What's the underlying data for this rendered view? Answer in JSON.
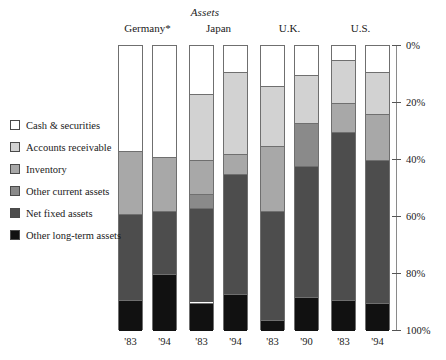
{
  "chart_data": {
    "type": "bar",
    "subtype": "stacked-bar-100-percent",
    "title": "Assets",
    "xlabel": "",
    "ylabel": "",
    "ylim": [
      0,
      100
    ],
    "y_axis_inverted": true,
    "grid": false,
    "legend_position": "left",
    "ytick_labels": [
      "0%",
      "20%",
      "40%",
      "60%",
      "80%",
      "100%"
    ],
    "ytick_values": [
      0,
      20,
      40,
      60,
      80,
      100
    ],
    "groups": [
      "Germany*",
      "Japan",
      "U.K.",
      "U.S."
    ],
    "categories": [
      "'83",
      "'94",
      "'83",
      "'94",
      "'83",
      "'90",
      "'83",
      "'94"
    ],
    "series": [
      {
        "name": "Cash & securities",
        "color": "#ffffff",
        "values": [
          37,
          39,
          17,
          9,
          14,
          10,
          5,
          9
        ]
      },
      {
        "name": "Accounts receivable",
        "color": "#d2d2d2",
        "values": [
          0,
          0,
          23,
          29,
          21,
          17,
          15,
          15
        ]
      },
      {
        "name": "Inventory",
        "color": "#a8a8a8",
        "values": [
          22,
          19,
          12,
          7,
          23,
          0,
          10,
          16
        ]
      },
      {
        "name": "Other current assets",
        "color": "#8a8a8a",
        "values": [
          0,
          0,
          5,
          0,
          0,
          15,
          0,
          0
        ]
      },
      {
        "name": "Net fixed assets",
        "color": "#4d4d4d",
        "values": [
          30,
          22,
          33,
          42,
          38,
          46,
          59,
          50
        ]
      },
      {
        "name": "Other long-term assets",
        "color": "#111111",
        "values": [
          11,
          20,
          10,
          13,
          4,
          12,
          11,
          10
        ]
      }
    ],
    "bars": [
      {
        "group": "Germany*",
        "category": "'83",
        "segments": [
          {
            "name": "Cash & securities",
            "value": 37
          },
          {
            "name": "Inventory",
            "value": 22
          },
          {
            "name": "Net fixed assets",
            "value": 30
          },
          {
            "name": "Other long-term assets",
            "value": 11
          }
        ]
      },
      {
        "group": "Germany*",
        "category": "'94",
        "segments": [
          {
            "name": "Cash & securities",
            "value": 39
          },
          {
            "name": "Inventory",
            "value": 19
          },
          {
            "name": "Net fixed assets",
            "value": 22
          },
          {
            "name": "Other long-term assets",
            "value": 20
          }
        ]
      },
      {
        "group": "Japan",
        "category": "'83",
        "segments": [
          {
            "name": "Cash & securities",
            "value": 17
          },
          {
            "name": "Accounts receivable",
            "value": 23
          },
          {
            "name": "Inventory",
            "value": 12
          },
          {
            "name": "Other current assets",
            "value": 5
          },
          {
            "name": "Net fixed assets",
            "value": 33
          },
          {
            "name": "Other long-term assets",
            "value": 10
          }
        ]
      },
      {
        "group": "Japan",
        "category": "'94",
        "segments": [
          {
            "name": "Cash & securities",
            "value": 9
          },
          {
            "name": "Accounts receivable",
            "value": 29
          },
          {
            "name": "Inventory",
            "value": 7
          },
          {
            "name": "Net fixed assets",
            "value": 42
          },
          {
            "name": "Other long-term assets",
            "value": 13
          }
        ]
      },
      {
        "group": "U.K.",
        "category": "'83",
        "segments": [
          {
            "name": "Cash & securities",
            "value": 14
          },
          {
            "name": "Accounts receivable",
            "value": 21
          },
          {
            "name": "Inventory",
            "value": 23
          },
          {
            "name": "Net fixed assets",
            "value": 38
          },
          {
            "name": "Other long-term assets",
            "value": 4
          }
        ]
      },
      {
        "group": "U.K.",
        "category": "'90",
        "segments": [
          {
            "name": "Cash & securities",
            "value": 10
          },
          {
            "name": "Accounts receivable",
            "value": 17
          },
          {
            "name": "Other current assets",
            "value": 15
          },
          {
            "name": "Net fixed assets",
            "value": 46
          },
          {
            "name": "Other long-term assets",
            "value": 12
          }
        ]
      },
      {
        "group": "U.S.",
        "category": "'83",
        "segments": [
          {
            "name": "Cash & securities",
            "value": 5
          },
          {
            "name": "Accounts receivable",
            "value": 15
          },
          {
            "name": "Inventory",
            "value": 10
          },
          {
            "name": "Net fixed assets",
            "value": 59
          },
          {
            "name": "Other long-term assets",
            "value": 11
          }
        ]
      },
      {
        "group": "U.S.",
        "category": "'94",
        "segments": [
          {
            "name": "Cash & securities",
            "value": 9
          },
          {
            "name": "Accounts receivable",
            "value": 15
          },
          {
            "name": "Inventory",
            "value": 16
          },
          {
            "name": "Net fixed assets",
            "value": 50
          },
          {
            "name": "Other long-term assets",
            "value": 10
          }
        ]
      }
    ]
  },
  "legend": {
    "items": [
      {
        "label": "Cash & securities",
        "color": "#ffffff"
      },
      {
        "label": "Accounts receivable",
        "color": "#d2d2d2"
      },
      {
        "label": "Inventory",
        "color": "#a8a8a8"
      },
      {
        "label": "Other current assets",
        "color": "#8a8a8a"
      },
      {
        "label": "Net fixed assets",
        "color": "#4d4d4d"
      },
      {
        "label": "Other long-term assets",
        "color": "#111111"
      }
    ]
  },
  "colors": {
    "cash_and_securities": "#ffffff",
    "accounts_receivable": "#d2d2d2",
    "inventory": "#a8a8a8",
    "other_current_assets": "#8a8a8a",
    "net_fixed_assets": "#4d4d4d",
    "other_long_term_assets": "#111111",
    "axis": "#8a8a8a",
    "outline": "#6f6f6f",
    "text": "#1a1a1a",
    "background": "#ffffff"
  }
}
